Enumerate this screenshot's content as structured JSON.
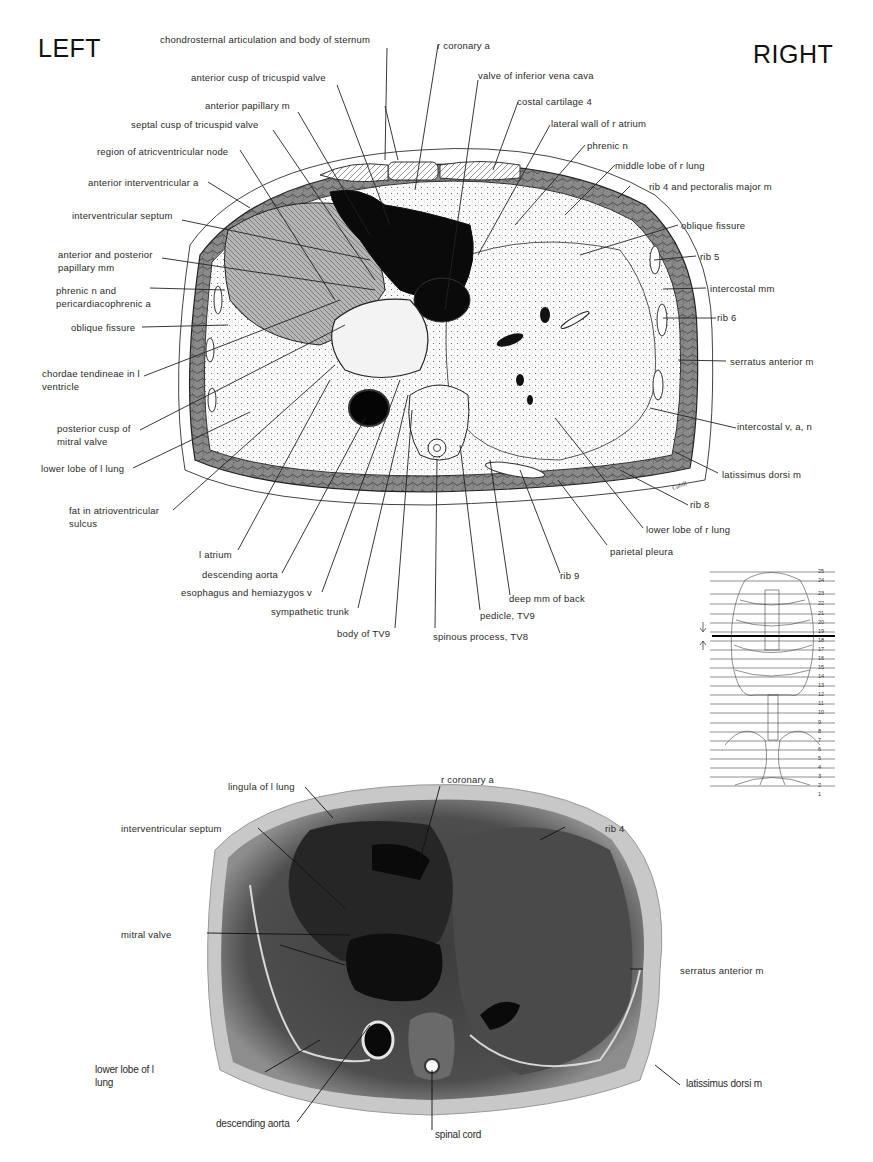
{
  "orientation": {
    "left": "LEFT",
    "right": "RIGHT"
  },
  "drawing": {
    "labels_top": [
      "chondrosternal articulation and body of sternum",
      "r coronary a",
      "anterior cusp of tricuspid valve",
      "valve of inferior vena cava",
      "anterior papillary m",
      "costal cartilage 4",
      "septal cusp of tricuspid valve",
      "lateral wall of r atrium",
      "region of atricventricular node",
      "phrenic n",
      "middle lobe of r lung",
      "anterior interventricular a",
      "rib 4 and pectoralis major m"
    ],
    "labels_left": [
      "interventricular septum",
      "anterior and posterior papillary mm",
      "phrenic n and pericardiacophrenic a",
      "oblique fissure",
      "chordae tendineae in l ventricle",
      "posterior cusp of mitral valve",
      "lower lobe of l lung",
      "fat in atrioventricular sulcus"
    ],
    "labels_right": [
      "oblique fissure",
      "rib 5",
      "intercostal mm",
      "rib 6",
      "serratus anterior m",
      "intercostal v, a, n",
      "latissimus dorsi m",
      "rib 8",
      "lower lobe of r lung",
      "parietal pleura"
    ],
    "labels_bottom": [
      "l atrium",
      "descending aorta",
      "esophagus and hemiazygos v",
      "sympathetic trunk",
      "body of TV9",
      "spinous process, TV8",
      "pedicle, TV9",
      "deep mm of back",
      "rib 9"
    ],
    "signature": "Cahill"
  },
  "key_figure": {
    "level_numbers": [
      "25",
      "24",
      "23",
      "22",
      "21",
      "20",
      "19",
      "18",
      "17",
      "16",
      "15",
      "14",
      "13",
      "12",
      "11",
      "10",
      "9",
      "8",
      "7",
      "6",
      "5",
      "4",
      "3",
      "2",
      "1"
    ],
    "highlighted_level": "19"
  },
  "photo": {
    "labels": [
      "lingula of l lung",
      "r coronary a",
      "rib 4",
      "interventricular septum",
      "mitral valve",
      "serratus anterior m",
      "lower lobe of l lung",
      "latissimus dorsi m",
      "descending aorta",
      "spinal cord"
    ]
  }
}
